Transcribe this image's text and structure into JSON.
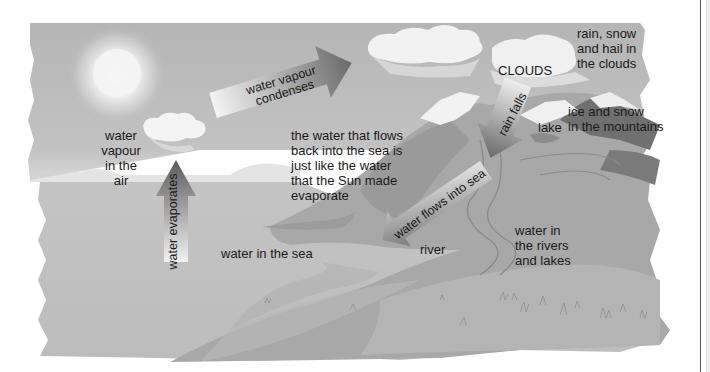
{
  "diagram": {
    "colors": {
      "sky": "#b8b8b8",
      "sea": "#bdbdbd",
      "land": "#a9a9a9",
      "mountain_dark": "#6e6e6e",
      "snow": "#f4f4f4",
      "text": "#1a1a1a"
    },
    "labels": {
      "water_vapour_air": "water\nvapour\nin the\nair",
      "water_evaporates": "water evaporates",
      "water_vapour_condenses": "water vapour\ncondenses",
      "clouds": "CLOUDS",
      "rain_snow_hail": "rain, snow\nand hail in\nthe clouds",
      "rain_falls": "rain falls",
      "ice_snow_mountains": "ice and snow\nin the mountains",
      "lake": "lake",
      "water_flows_back": "the water that flows\nback into the sea is\njust like the water\nthat the Sun made\nevaporate",
      "water_flows_into_sea": "water flows into sea",
      "water_in_sea": "water in the sea",
      "river": "river",
      "water_rivers_lakes": "water in\nthe rivers\nand lakes"
    }
  }
}
